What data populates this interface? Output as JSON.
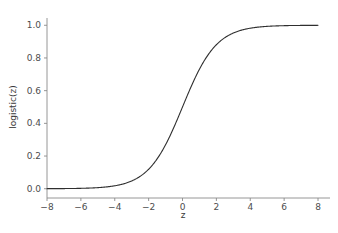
{
  "chart_data": {
    "type": "line",
    "title": "",
    "subtitle": "",
    "xlabel": "z",
    "ylabel": "logistic(z)",
    "xlim": [
      -8,
      8
    ],
    "ylim": [
      -0.02,
      1.02
    ],
    "xticks": [
      -8,
      -6,
      -4,
      -2,
      0,
      2,
      4,
      6,
      8
    ],
    "xtick_labels": [
      "−8",
      "−6",
      "−4",
      "−2",
      "0",
      "2",
      "4",
      "6",
      "8"
    ],
    "yticks": [
      0.0,
      0.2,
      0.4,
      0.6,
      0.8,
      1.0
    ],
    "ytick_labels": [
      "0.0",
      "0.2",
      "0.4",
      "0.6",
      "0.8",
      "1.0"
    ],
    "grid": false,
    "legend": null,
    "legend_position": "none",
    "line_color": "#2f2f2f",
    "line_width": 1.1,
    "spines": [
      "left",
      "bottom"
    ],
    "series": [
      {
        "name": "logistic(z)",
        "formula": "1 / (1 + exp(-z))",
        "x": [
          -8.0,
          -7.5,
          -7.0,
          -6.5,
          -6.0,
          -5.5,
          -5.0,
          -4.5,
          -4.0,
          -3.5,
          -3.0,
          -2.5,
          -2.0,
          -1.5,
          -1.0,
          -0.5,
          0.0,
          0.5,
          1.0,
          1.5,
          2.0,
          2.5,
          3.0,
          3.5,
          4.0,
          4.5,
          5.0,
          5.5,
          6.0,
          6.5,
          7.0,
          7.5,
          8.0
        ],
        "y": [
          0.000335,
          0.000553,
          0.000911,
          0.001503,
          0.002473,
          0.00407,
          0.006693,
          0.010987,
          0.017986,
          0.029312,
          0.047426,
          0.075858,
          0.119203,
          0.182426,
          0.268941,
          0.377541,
          0.5,
          0.622459,
          0.731059,
          0.817574,
          0.880797,
          0.924142,
          0.952574,
          0.970688,
          0.982014,
          0.989013,
          0.993307,
          0.99593,
          0.997527,
          0.998497,
          0.999089,
          0.999447,
          0.999665
        ]
      }
    ]
  },
  "axes": {
    "x_axis_name": "z-axis",
    "y_axis_name": "logistic-axis"
  }
}
